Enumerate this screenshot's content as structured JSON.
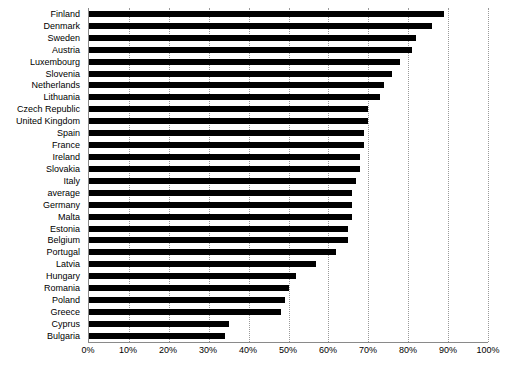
{
  "chart": {
    "type": "bar",
    "orientation": "horizontal",
    "title": "",
    "xlabel": "",
    "ylabel": ""
  },
  "axis": {
    "x_ticks": [
      "0%",
      "10%",
      "20%",
      "30%",
      "40%",
      "50%",
      "60%",
      "70%",
      "80%",
      "90%",
      "100%"
    ],
    "x_min": 0,
    "x_max": 100
  },
  "colors": {
    "bar": "#000000",
    "grid": "#9a9a9a",
    "axis": "#8a8a8a",
    "background": "#ffffff",
    "text": "#000000"
  },
  "chart_data": {
    "type": "bar",
    "title": "",
    "xlabel": "",
    "ylabel": "",
    "xlim": [
      0,
      100
    ],
    "grid": true,
    "legend": "none",
    "orientation": "horizontal",
    "categories": [
      "Finland",
      "Denmark",
      "Sweden",
      "Austria",
      "Luxembourg",
      "Slovenia",
      "Netherlands",
      "Lithuania",
      "Czech Republic",
      "United Kingdom",
      "Spain",
      "France",
      "Ireland",
      "Slovakia",
      "Italy",
      "average",
      "Germany",
      "Malta",
      "Estonia",
      "Belgium",
      "Portugal",
      "Latvia",
      "Hungary",
      "Romania",
      "Poland",
      "Greece",
      "Cyprus",
      "Bulgaria"
    ],
    "values": [
      89,
      86,
      82,
      81,
      78,
      76,
      74,
      73,
      70,
      70,
      69,
      69,
      68,
      68,
      67,
      66,
      66,
      66,
      65,
      65,
      62,
      57,
      52,
      50,
      49,
      48,
      35,
      34
    ],
    "value_unit": "%"
  }
}
